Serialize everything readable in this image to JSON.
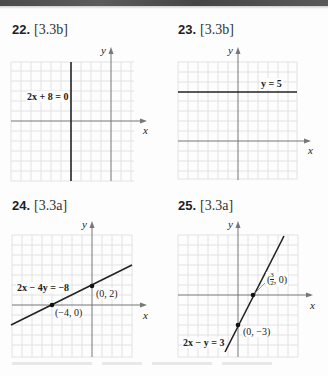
{
  "page": {
    "header_band": "dark-textured-strip"
  },
  "problems": [
    {
      "number": "22.",
      "section": "[3.3b]",
      "equation": "2x + 8 = 0",
      "axis_x_label": "x",
      "axis_y_label": "y",
      "points": []
    },
    {
      "number": "23.",
      "section": "[3.3b]",
      "equation": "y = 5",
      "axis_x_label": "x",
      "axis_y_label": "y",
      "points": []
    },
    {
      "number": "24.",
      "section": "[3.3a]",
      "equation": "2x − 4y = −8",
      "axis_x_label": "x",
      "axis_y_label": "y",
      "points": [
        {
          "label": "(0, 2)"
        },
        {
          "label": "(−4, 0)"
        }
      ]
    },
    {
      "number": "25.",
      "section": "[3.3a]",
      "equation": "2x − y = 3",
      "axis_x_label": "x",
      "axis_y_label": "y",
      "points": [
        {
          "label_num": "3",
          "label_den": "2",
          "label_rest": ", 0)",
          "label_open": "("
        },
        {
          "label": "(0, −3)"
        }
      ]
    }
  ],
  "colors": {
    "grid": "#e2e2e2",
    "axis": "#777777",
    "line": "#222222",
    "background": "#fdfdfd"
  }
}
